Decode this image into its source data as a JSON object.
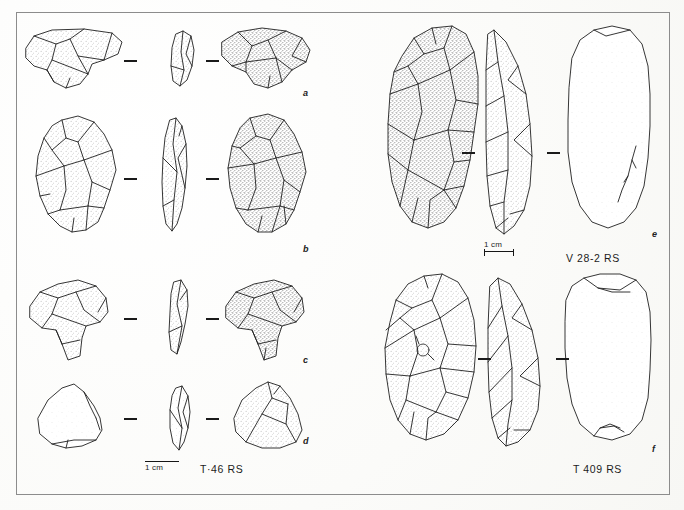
{
  "figure": {
    "kind": "archaeological-lithics-plate",
    "background_color": "#fdfdfb",
    "frame_color": "#8c8c8c",
    "ink_color": "#1a1a1a"
  },
  "left_group": {
    "catalog_label": "T·46 RS",
    "scale": {
      "text": "1 cm",
      "bar_px": 34
    },
    "items": [
      {
        "letter": "a",
        "views": [
          "obverse",
          "profile",
          "reverse"
        ],
        "type": "tanged-flake-tool"
      },
      {
        "letter": "b",
        "views": [
          "obverse",
          "profile",
          "reverse"
        ],
        "type": "tanged-point"
      },
      {
        "letter": "c",
        "views": [
          "obverse",
          "profile",
          "reverse"
        ],
        "type": "tanged-flake-tool"
      },
      {
        "letter": "d",
        "views": [
          "obverse",
          "profile",
          "reverse"
        ],
        "type": "triangular-flake"
      }
    ]
  },
  "right_group": {
    "items": [
      {
        "letter": "e",
        "catalog_label": "V 28-2 RS",
        "views": [
          "dorsal",
          "profile",
          "ventral"
        ],
        "type": "ovate-biface",
        "scale": {
          "text": "1 cm",
          "bar_px": 30
        }
      },
      {
        "letter": "f",
        "catalog_label": "T 409 RS",
        "views": [
          "dorsal",
          "profile",
          "ventral"
        ],
        "type": "ovate-biface"
      }
    ]
  },
  "separators": {
    "glyph": "dash",
    "count_per_item": 2
  }
}
